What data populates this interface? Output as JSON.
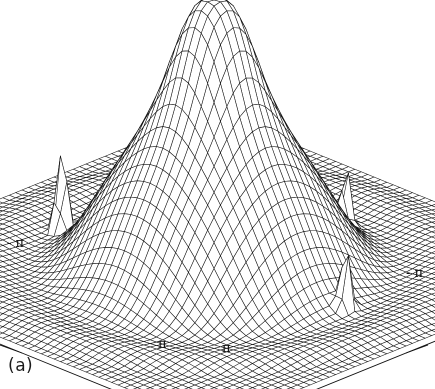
{
  "figure": {
    "caption": "(a)",
    "background": "#ffffff",
    "ink": "#111111"
  },
  "axis_labels": {
    "left": "- π",
    "right": "- π",
    "front_left": "π",
    "front_right": "π"
  },
  "chart_data": {
    "type": "line",
    "render": "3d-wireframe-surface",
    "title": "",
    "subtitle": "",
    "xlabel": "",
    "ylabel": "",
    "zlabel": "",
    "grid": false,
    "legend": null,
    "legend_position": "none",
    "xlim": [
      -3.14159,
      3.14159
    ],
    "ylim": [
      -3.14159,
      3.14159
    ],
    "zlim": [
      0,
      1
    ],
    "x_tick_labels": [
      "- π",
      "π"
    ],
    "y_tick_labels": [
      "- π",
      "π"
    ],
    "x_ticks": [
      -3.14159,
      0,
      3.14159
    ],
    "y_ticks": [
      -3.14159,
      0,
      3.14159
    ],
    "mesh": {
      "nx": 61,
      "ny": 61
    },
    "view": {
      "azimuth_deg": 45,
      "elevation_deg": 26,
      "projection": "oblique"
    },
    "surface_model": {
      "description": "Two-dimensional windowed spectrum: broad central mainlobe with concentric ripple sidelobes plus three narrow impulse spikes.",
      "main_lobe": {
        "center_x": 0.0,
        "center_y": 0.0,
        "amplitude": 1.0,
        "width": 0.78
      },
      "ripple": {
        "amplitude": 0.085,
        "wavelength": 1.35,
        "decay": 0.62
      },
      "spikes": [
        {
          "label": "spike-left",
          "x": -1.95,
          "y": 0.55,
          "amplitude": 0.4,
          "width": 0.055
        },
        {
          "label": "spike-front",
          "x": 0.3,
          "y": -1.85,
          "amplitude": 0.23,
          "width": 0.055
        },
        {
          "label": "spike-right",
          "x": 1.95,
          "y": -0.2,
          "amplitude": 0.26,
          "width": 0.055
        }
      ]
    },
    "series": [
      {
        "name": "surface",
        "peak_value": 1.0,
        "baseline": 0.0,
        "sidelobe_peaks": [
          0.085,
          0.052,
          0.032,
          0.019
        ],
        "spike_values": [
          0.4,
          0.26,
          0.23
        ]
      }
    ],
    "annotations": [
      {
        "text": "- π",
        "role": "x-axis-min"
      },
      {
        "text": "- π",
        "role": "y-axis-min"
      },
      {
        "text": "π",
        "role": "x-axis-max"
      },
      {
        "text": "π",
        "role": "y-axis-max"
      }
    ]
  }
}
